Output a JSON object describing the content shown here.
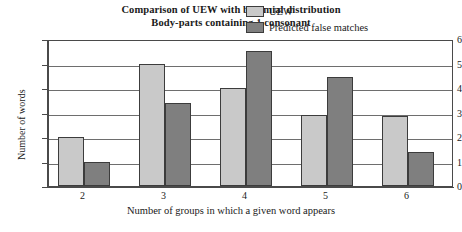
{
  "chart_data": {
    "type": "bar",
    "title": "Comparison of UEW with binomial distribution",
    "subtitle": "Body-parts containing 1 consonant",
    "xlabel": "Number of groups in which a given word appears",
    "ylabel": "Number of words",
    "categories": [
      "2",
      "3",
      "4",
      "5",
      "6"
    ],
    "series": [
      {
        "name": "UEW",
        "color": "#c9c9c9",
        "values": [
          2,
          5,
          4,
          2.9,
          2.85
        ]
      },
      {
        "name": "Predicted false matches",
        "color": "#7f7f7f",
        "values": [
          1,
          3.4,
          5.5,
          4.45,
          1.4
        ]
      }
    ],
    "ylim": [
      0,
      6
    ],
    "yticks": [
      0,
      1,
      2,
      3,
      4,
      5,
      6
    ],
    "ytick_labels": [
      "0",
      "1",
      "2",
      "3",
      "4",
      "5",
      "6"
    ],
    "grid": true,
    "legend_position": "top-right"
  }
}
